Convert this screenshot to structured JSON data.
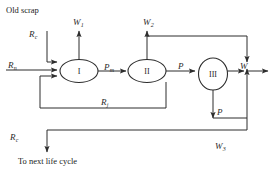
{
  "figure": {
    "type": "flow-diagram",
    "title_top_left": "Old scrap",
    "caption_bottom_left": "To next life cycle"
  },
  "nodes": [
    {
      "id": "stage-1",
      "label": "I",
      "shape": "ellipse"
    },
    {
      "id": "stage-2",
      "label": "II",
      "shape": "ellipse"
    },
    {
      "id": "stage-3",
      "label": "III",
      "shape": "ellipse"
    }
  ],
  "flow_labels": {
    "old_scrap": "Old scrap",
    "r_c_top": {
      "base": "R",
      "sub": "c"
    },
    "r_n": {
      "base": "R",
      "sub": "n"
    },
    "r_c_bottom": {
      "base": "R",
      "sub": "c"
    },
    "r_j": {
      "base": "R",
      "sub": "j"
    },
    "p_m": {
      "base": "P",
      "sub": "m"
    },
    "p_mid": {
      "base": "P",
      "sub": ""
    },
    "p_down": {
      "base": "P",
      "sub": ""
    },
    "w_1": {
      "base": "W",
      "sub": "1"
    },
    "w_2": {
      "base": "W",
      "sub": "2"
    },
    "w_3": {
      "base": "W",
      "sub": "3"
    },
    "w_out": {
      "base": "W",
      "sub": ""
    },
    "to_next_life_cycle": "To next life cycle"
  },
  "style": {
    "line_color": "#2d2d2d",
    "text_color": "#1b1b1b",
    "background": "#ffffff"
  }
}
